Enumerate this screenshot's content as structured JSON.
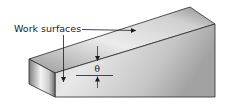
{
  "diagram": {
    "labels": {
      "work_surfaces": "Work surfaces",
      "angle": "θ"
    },
    "colors": {
      "edge": "#2a2a2a",
      "top_face_light": "#f2f2f2",
      "top_face_dark": "#8c8c8c",
      "front_face_light": "#e6e6e6",
      "front_face_dark": "#a9a9a9",
      "end_face_light": "#f5f5f5",
      "end_face_dark": "#7a7a7a",
      "annotation": "#1a1a1a"
    }
  }
}
